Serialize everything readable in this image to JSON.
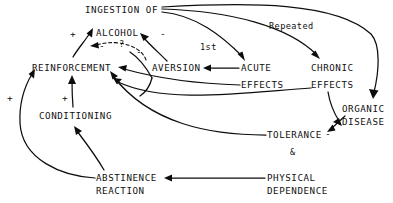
{
  "diagram": {
    "ink_color": "#0d0d0d",
    "background": "#ffffff",
    "nodes": [
      {
        "id": "ingestion",
        "lines": [
          "INGESTION OF",
          "ALCOHOL"
        ]
      },
      {
        "id": "reinforcement",
        "lines": [
          "REINFORCEMENT"
        ]
      },
      {
        "id": "aversion",
        "lines": [
          "AVERSION"
        ]
      },
      {
        "id": "acute",
        "lines": [
          "ACUTE",
          "EFFECTS"
        ]
      },
      {
        "id": "chronic",
        "lines": [
          "CHRONIC",
          "EFFECTS"
        ]
      },
      {
        "id": "organic",
        "lines": [
          "ORGANIC",
          "DISEASE"
        ]
      },
      {
        "id": "tolerance",
        "lines": [
          "TOLERANCE"
        ]
      },
      {
        "id": "physical",
        "lines": [
          "PHYSICAL",
          "DEPENDENCE"
        ]
      },
      {
        "id": "abstinence",
        "lines": [
          "ABSTINENCE",
          "REACTION"
        ]
      },
      {
        "id": "conditioning",
        "lines": [
          "CONDITIONING"
        ]
      }
    ],
    "node_text": {
      "ingestion_of": "INGESTION OF",
      "alcohol": "ALCOHOL",
      "reinforcement": "REINFORCEMENT",
      "aversion": "AVERSION",
      "acute": "ACUTE",
      "acute_effects": "EFFECTS",
      "chronic": "CHRONIC",
      "chronic_effects": "EFFECTS",
      "organic": "ORGANIC",
      "disease": "DISEASE",
      "tolerance": "TOLERANCE",
      "physical": "PHYSICAL",
      "dependence": "DEPENDENCE",
      "abstinence": "ABSTINENCE",
      "reaction": "REACTION",
      "conditioning": "CONDITIONING"
    },
    "edge_labels": {
      "first": "1st",
      "repeated": "Repeated",
      "question": "?",
      "ampersand": "&"
    },
    "sign_labels": {
      "plus_reinforcement_to_alcohol": "+",
      "minus_aversion_to_alcohol": "-",
      "minus_dashed_to_reinforcement": "-",
      "minus_aversion_curve": "-",
      "minus_organic_to_tolerance": "-",
      "plus_abstinence_to_reinforcement": "+",
      "plus_conditioning_to_reinforcement": "+"
    },
    "edges": [
      {
        "from": "ingestion",
        "to": "acute",
        "label": "1st",
        "sign": "",
        "style": "solid"
      },
      {
        "from": "ingestion",
        "to": "chronic",
        "label": "Repeated",
        "sign": "",
        "style": "solid"
      },
      {
        "from": "ingestion",
        "to": "organic",
        "label": "",
        "sign": "",
        "style": "solid"
      },
      {
        "from": "acute",
        "to": "aversion",
        "label": "",
        "sign": "",
        "style": "solid"
      },
      {
        "from": "acute",
        "to": "reinforcement",
        "label": "",
        "sign": "",
        "style": "solid"
      },
      {
        "from": "aversion",
        "to": "ingestion",
        "label": "",
        "sign": "-",
        "style": "solid"
      },
      {
        "from": "reinforcement",
        "to": "ingestion",
        "label": "",
        "sign": "+",
        "style": "solid"
      },
      {
        "from": "aversion",
        "to": "reinforcement",
        "label": "?",
        "sign": "-",
        "style": "dashed"
      },
      {
        "from": "chronic",
        "to": "tolerance",
        "label": "",
        "sign": "",
        "style": "solid"
      },
      {
        "from": "chronic",
        "to": "reinforcement",
        "label": "",
        "sign": "",
        "style": "solid"
      },
      {
        "from": "organic",
        "to": "tolerance",
        "label": "",
        "sign": "-",
        "style": "solid"
      },
      {
        "from": "tolerance",
        "to": "reinforcement",
        "label": "",
        "sign": "",
        "style": "solid"
      },
      {
        "from": "physical",
        "to": "abstinence",
        "label": "",
        "sign": "",
        "style": "solid"
      },
      {
        "from": "abstinence",
        "to": "reinforcement",
        "label": "",
        "sign": "+",
        "style": "solid"
      },
      {
        "from": "abstinence",
        "to": "conditioning",
        "label": "",
        "sign": "",
        "style": "solid"
      },
      {
        "from": "conditioning",
        "to": "reinforcement",
        "label": "",
        "sign": "+",
        "style": "solid"
      }
    ]
  }
}
